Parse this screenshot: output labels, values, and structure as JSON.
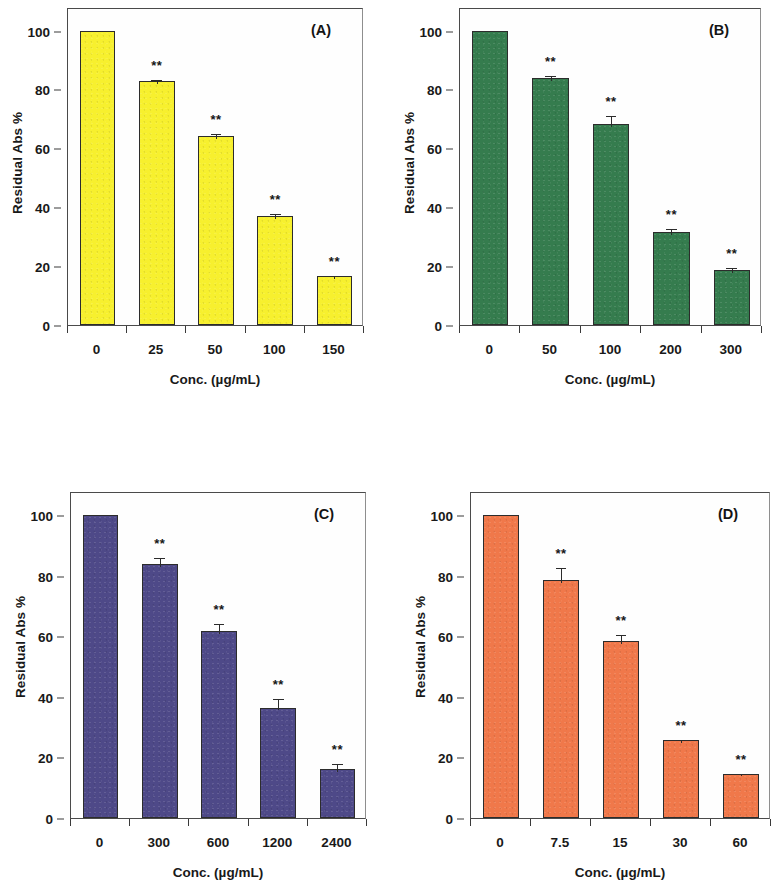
{
  "figure": {
    "panel_count": 4,
    "shared_ylabel": "Residual Abs %",
    "shared_xlabel": "Conc. (µg/mL)",
    "significance_marker": "**"
  },
  "chart_data": [
    {
      "type": "bar",
      "panel": "(A)",
      "title": "",
      "xlabel": "Conc. (µg/mL)",
      "ylabel": "Residual Abs %",
      "categories": [
        "0",
        "25",
        "50",
        "100",
        "150"
      ],
      "values": [
        100,
        83,
        64.3,
        37,
        16.5
      ],
      "errors": [
        0,
        1.0,
        1.2,
        1.3,
        0.7
      ],
      "annotations": [
        "",
        "**",
        "**",
        "**",
        "**"
      ],
      "yticks": [
        0,
        20,
        40,
        60,
        80,
        100
      ],
      "ylim": [
        0,
        108
      ],
      "grid": false,
      "legend": "none",
      "bar_color": "#F7F02E",
      "bar_edge_color": "#2c2c2c"
    },
    {
      "type": "bar",
      "panel": "(B)",
      "title": "",
      "xlabel": "Conc. (µg/mL)",
      "ylabel": "Residual Abs %",
      "categories": [
        "0",
        "50",
        "100",
        "200",
        "300"
      ],
      "values": [
        100,
        84,
        68.3,
        31.5,
        18.8
      ],
      "errors": [
        0,
        1.2,
        3.2,
        1.8,
        1.2
      ],
      "annotations": [
        "",
        "**",
        "**",
        "**",
        "**"
      ],
      "yticks": [
        0,
        20,
        40,
        60,
        80,
        100
      ],
      "ylim": [
        0,
        108
      ],
      "grid": false,
      "legend": "none",
      "bar_color": "#357C4E",
      "bar_edge_color": "#2c2c2c"
    },
    {
      "type": "bar",
      "panel": "(C)",
      "title": "",
      "xlabel": "Conc. (µg/mL)",
      "ylabel": "Residual Abs %",
      "categories": [
        "0",
        "300",
        "600",
        "1200",
        "2400"
      ],
      "values": [
        100,
        83.8,
        61.8,
        36.5,
        16.2
      ],
      "errors": [
        0,
        2.8,
        3.0,
        3.5,
        2.2
      ],
      "annotations": [
        "",
        "**",
        "**",
        "**",
        "**"
      ],
      "yticks": [
        0,
        20,
        40,
        60,
        80,
        100
      ],
      "ylim": [
        0,
        108
      ],
      "grid": false,
      "legend": "none",
      "bar_color": "#4E4988",
      "bar_edge_color": "#2c2c2c"
    },
    {
      "type": "bar",
      "panel": "(D)",
      "title": "",
      "xlabel": "Conc. (µg/mL)",
      "ylabel": "Residual Abs %",
      "categories": [
        "0",
        "7.5",
        "15",
        "30",
        "60"
      ],
      "values": [
        100,
        78.6,
        58.3,
        25.7,
        14.7
      ],
      "errors": [
        0,
        4.5,
        2.8,
        0.7,
        0.6
      ],
      "annotations": [
        "",
        "**",
        "**",
        "**",
        "**"
      ],
      "yticks": [
        0,
        20,
        40,
        60,
        80,
        100
      ],
      "ylim": [
        0,
        108
      ],
      "grid": false,
      "legend": "none",
      "bar_color": "#F0784A",
      "bar_edge_color": "#2c2c2c"
    }
  ]
}
